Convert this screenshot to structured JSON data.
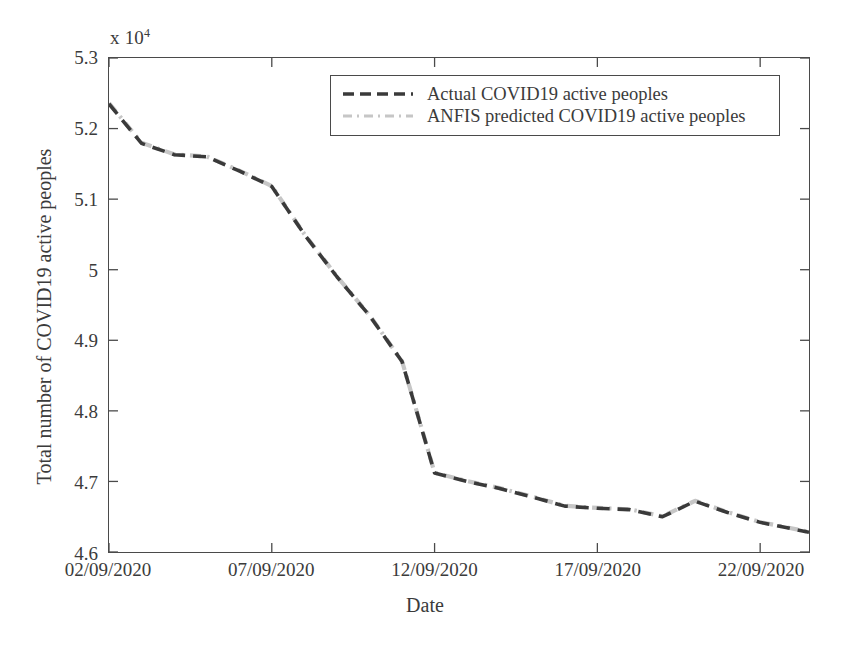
{
  "chart_data": {
    "type": "line",
    "title": "",
    "xlabel": "Date",
    "ylabel": "Total number of COVID19 active peoples",
    "y_exponent_prefix": "x 10",
    "y_exponent_power": "4",
    "y_scale": 10000,
    "ylim": [
      4.6,
      5.3
    ],
    "y_ticks": [
      "4.6",
      "4.7",
      "4.8",
      "4.9",
      "5",
      "5.1",
      "5.2",
      "5.3"
    ],
    "y_tick_values": [
      4.6,
      4.7,
      4.8,
      4.9,
      5.0,
      5.1,
      5.2,
      5.3
    ],
    "x_ticks": [
      "02/09/2020",
      "07/09/2020",
      "12/09/2020",
      "17/09/2020",
      "22/09/2020"
    ],
    "x_tick_values": [
      0,
      5,
      10,
      15,
      20
    ],
    "xlim": [
      0,
      21.5
    ],
    "grid": false,
    "legend_position": "top-center",
    "x": [
      0,
      1,
      2,
      3,
      4,
      5,
      6,
      7,
      8,
      9,
      10,
      11,
      12,
      13,
      14,
      15,
      16,
      17,
      18,
      19,
      20,
      21.5
    ],
    "x_dates": [
      "02/09/2020",
      "03/09/2020",
      "04/09/2020",
      "05/09/2020",
      "06/09/2020",
      "07/09/2020",
      "08/09/2020",
      "09/09/2020",
      "10/09/2020",
      "11/09/2020",
      "12/09/2020",
      "13/09/2020",
      "14/09/2020",
      "15/09/2020",
      "16/09/2020",
      "17/09/2020",
      "18/09/2020",
      "19/09/2020",
      "20/09/2020",
      "21/09/2020",
      "22/09/2020",
      "23/09/2020"
    ],
    "series": [
      {
        "name": "Actual COVID19 active peoples",
        "style": "dashed",
        "color": "#3a3a3a",
        "values": [
          52350,
          51790,
          51630,
          51600,
          51400,
          51180,
          50500,
          49900,
          49350,
          48700,
          47120,
          47000,
          46900,
          46780,
          46650,
          46620,
          46600,
          46500,
          46720,
          46560,
          46420,
          46280
        ]
      },
      {
        "name": "ANFIS predicted COVID19 active peoples",
        "style": "dash-dot",
        "color": "#c6c6c6",
        "values": [
          52360,
          51800,
          51635,
          51605,
          51405,
          51185,
          50505,
          49905,
          49355,
          48705,
          47125,
          47005,
          46905,
          46785,
          46655,
          46625,
          46605,
          46505,
          46725,
          46565,
          46425,
          46285
        ]
      }
    ]
  },
  "legend": {
    "items": [
      {
        "label": "Actual COVID19 active peoples",
        "sample": "dashed-dark"
      },
      {
        "label": "ANFIS predicted COVID19 active peoples",
        "sample": "dashdot-light"
      }
    ]
  },
  "colors": {
    "actual": "#3a3a3a",
    "predicted": "#c6c6c6",
    "axis": "#4a4a4a",
    "text": "#3b3b3b",
    "background": "#ffffff"
  }
}
